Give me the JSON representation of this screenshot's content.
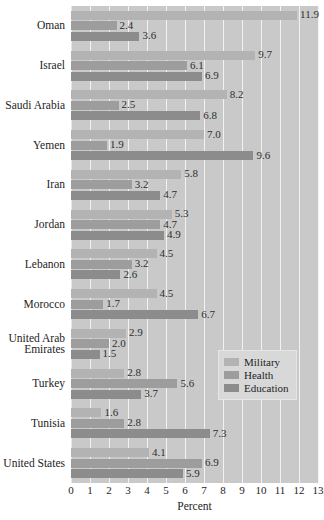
{
  "chart_data": {
    "type": "bar",
    "orientation": "horizontal",
    "title": "",
    "xlabel": "Percent",
    "ylabel": "",
    "xlim": [
      0,
      13
    ],
    "xticks": [
      "0",
      "1",
      "2",
      "3",
      "4",
      "5",
      "6",
      "7",
      "8",
      "9",
      "10",
      "11",
      "12",
      "13"
    ],
    "grid": true,
    "legend_position": "center-right",
    "categories": [
      "Oman",
      "Israel",
      "Saudi Arabia",
      "Yemen",
      "Iran",
      "Jordan",
      "Lebanon",
      "Morocco",
      "United Arab\nEmirates",
      "Turkey",
      "Tunisia",
      "United States"
    ],
    "series": [
      {
        "name": "Military",
        "color": "#b3b3b3",
        "values": [
          11.9,
          9.7,
          8.2,
          7.0,
          5.8,
          5.3,
          4.5,
          4.5,
          2.9,
          2.8,
          1.6,
          4.1
        ],
        "labels": [
          "11.9",
          "9.7",
          "8.2",
          "7.0",
          "5.8",
          "5.3",
          "4.5",
          "4.5",
          "2.9",
          "2.8",
          "1.6",
          "4.1"
        ]
      },
      {
        "name": "Health",
        "color": "#9d9d9d",
        "values": [
          2.4,
          6.1,
          2.5,
          1.9,
          3.2,
          4.7,
          3.2,
          1.7,
          2.0,
          5.6,
          2.8,
          6.9
        ],
        "labels": [
          "2.4",
          "6.1",
          "2.5",
          "1.9",
          "3.2",
          "4.7",
          "3.2",
          "1.7",
          "2.0",
          "5.6",
          "2.8",
          "6.9"
        ]
      },
      {
        "name": "Education",
        "color": "#8c8c8c",
        "values": [
          3.6,
          6.9,
          6.8,
          9.6,
          4.7,
          4.9,
          2.6,
          6.7,
          1.5,
          3.7,
          7.3,
          5.9
        ],
        "labels": [
          "3.6",
          "6.9",
          "6.8",
          "9.6",
          "4.7",
          "4.9",
          "2.6",
          "6.7",
          "1.5",
          "3.7",
          "7.3",
          "5.9"
        ]
      }
    ]
  },
  "legend": {
    "items": [
      "Military",
      "Health",
      "Education"
    ]
  },
  "axis": {
    "x_title": "Percent"
  },
  "clipped_title": ""
}
